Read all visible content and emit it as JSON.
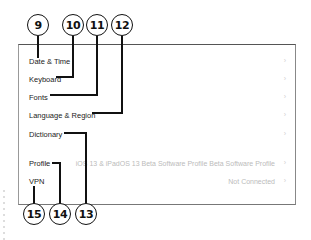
{
  "settings_list": {
    "rows": [
      {
        "label": "Date & Time",
        "value": "",
        "chevron": "›"
      },
      {
        "label": "Keyboard",
        "value": "",
        "chevron": "›"
      },
      {
        "label": "Fonts",
        "value": "",
        "chevron": "›"
      },
      {
        "label": "Language & Region",
        "value": "",
        "chevron": "›"
      },
      {
        "label": "Dictionary",
        "value": "",
        "chevron": "›"
      },
      {
        "label": "Profile",
        "value": "iOS 13 & iPadOS 13 Beta Software Profile Beta Software Profile",
        "chevron": "›"
      },
      {
        "label": "VPN",
        "value": "Not Connected",
        "chevron": "›"
      }
    ]
  },
  "callouts": {
    "top": [
      "9",
      "10",
      "11",
      "12"
    ],
    "bottom": [
      "15",
      "14",
      "13"
    ]
  }
}
